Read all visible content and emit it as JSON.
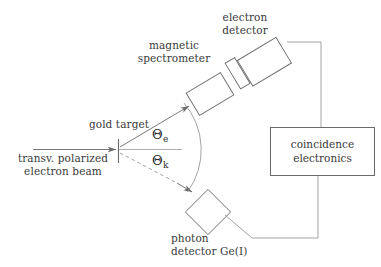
{
  "figure": {
    "background_color": "#ffffff",
    "stroke_color": "#555555",
    "text_color": "#3a3a3a",
    "width": 381,
    "height": 267
  },
  "beam": {
    "line1": "transv. polarized",
    "line2": "electron beam",
    "arrow_name": "incoming-electron-beam-arrow"
  },
  "target": {
    "label": "gold target",
    "tick_name": "gold-target-tick"
  },
  "angles": {
    "electron": {
      "symbol": "Θ",
      "subscript": "e"
    },
    "photon": {
      "symbol": "Θ",
      "subscript": "k"
    }
  },
  "spectrometer": {
    "line1": "magnetic",
    "line2": "spectrometer"
  },
  "electron_detector": {
    "line1": "electron",
    "line2": "detector"
  },
  "photon_detector": {
    "line1": "photon",
    "line2": "detector Ge(I)"
  },
  "coincidence": {
    "line1": "coincidence",
    "line2": "electronics"
  }
}
